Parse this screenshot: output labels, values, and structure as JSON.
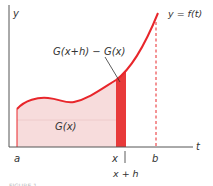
{
  "diagram": {
    "axis_labels": {
      "y": "y",
      "t": "t"
    },
    "curve_label": "y = f(t)",
    "strip_label": "G(x+h) − G(x)",
    "area_label": "G(x)",
    "tick_labels": {
      "a": "a",
      "x": "x",
      "b": "b",
      "x_plus_h": "x + h"
    },
    "caption": "FIGURE 1",
    "colors": {
      "curve": "#e8262b",
      "area_fill": "#f7dcdc",
      "strip_fill": "#e83a3a",
      "axis": "#555555",
      "text": "#333333"
    }
  }
}
